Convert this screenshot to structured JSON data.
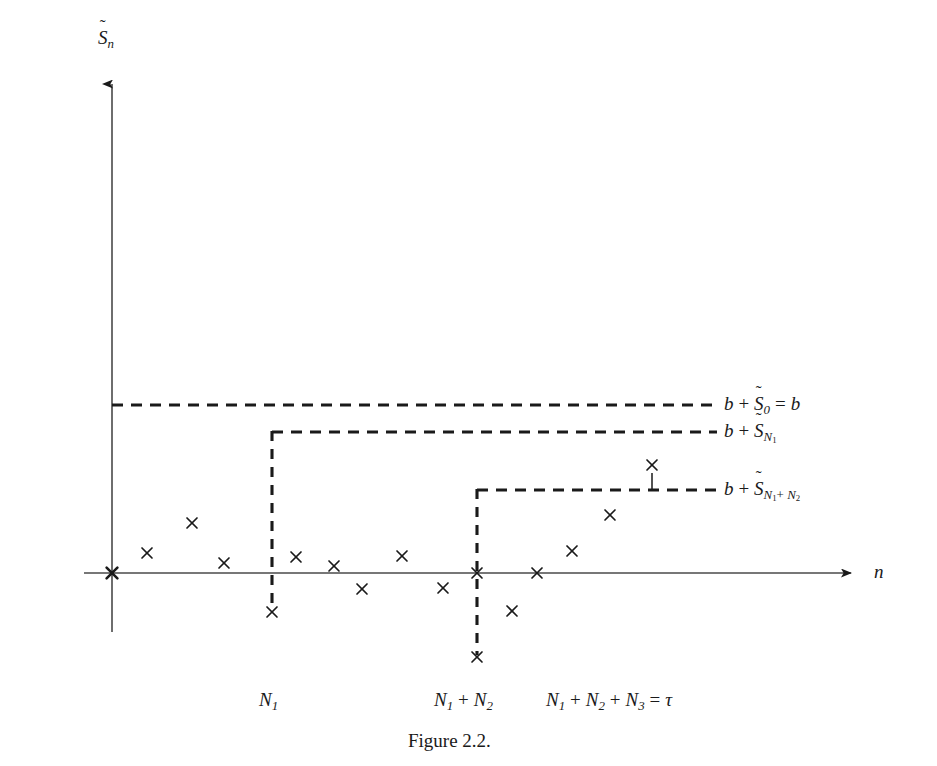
{
  "figure": {
    "caption": "Figure 2.2.",
    "axes": {
      "y_label_base": "S",
      "y_label_sub": "n",
      "y_label_accent": "~",
      "y_label_text": "S̃_n",
      "x_label_text": "n",
      "origin_marker": "x"
    },
    "level_labels": [
      {
        "id": "level-0",
        "prefix": "b",
        "plus": "+",
        "base": "S",
        "accent": "~",
        "sub": "0",
        "suffix_eq": "=",
        "suffix_val": "b",
        "text": "b + S̃0 = b"
      },
      {
        "id": "level-1",
        "prefix": "b",
        "plus": "+",
        "base": "S",
        "accent": "~",
        "sub": "N1",
        "sub_parts": [
          "N",
          "1"
        ],
        "text": "b + S̃_{N1}"
      },
      {
        "id": "level-2",
        "prefix": "b",
        "plus": "+",
        "base": "S",
        "accent": "~",
        "sub": "N1+N2",
        "sub_parts": [
          "N",
          "1",
          "+",
          "N",
          "2"
        ],
        "text": "b + S̃_{N1+N2}"
      }
    ],
    "x_tick_labels": [
      {
        "id": "tick-n1",
        "text": "N1",
        "parts": [
          "N",
          "1"
        ]
      },
      {
        "id": "tick-n1n2",
        "text": "N1 + N2",
        "parts": [
          "N",
          "1",
          "+",
          "N",
          "2"
        ]
      },
      {
        "id": "tick-tau",
        "text": "N1 + N2 + N3 = τ",
        "parts": [
          "N",
          "1",
          "+",
          "N",
          "2",
          "+",
          "N",
          "3",
          "=",
          "τ"
        ]
      }
    ],
    "colors": {
      "ink": "#1a1a1a",
      "axis": "#4a4a4a",
      "dash": "#1a1a1a",
      "background": "#ffffff"
    }
  },
  "chart_data": {
    "type": "scatter",
    "title": "Figure 2.2.",
    "xlabel": "n",
    "ylabel": "S̃_n",
    "grid": false,
    "legend": "none",
    "axis_origin_px": {
      "x": 112,
      "y": 573
    },
    "axis_x_range_px": [
      112,
      858
    ],
    "axis_y_top_px": 78,
    "axis_y_bottom_px": 632,
    "barrier_levels": [
      {
        "name": "b + S̃0 = b",
        "y_px": 405,
        "x_start_px": 112,
        "x_end_px": 717
      },
      {
        "name": "b + S̃_{N1}",
        "y_px": 432,
        "x_start_px": 272,
        "x_end_px": 717
      },
      {
        "name": "b + S̃_{N1+N2}",
        "y_px": 490,
        "x_start_px": 477,
        "x_end_px": 717
      }
    ],
    "ladder_drops": [
      {
        "x_px": 272,
        "y_top_px": 432,
        "y_bottom_px": 612,
        "label": "N1"
      },
      {
        "x_px": 477,
        "y_top_px": 490,
        "y_bottom_px": 657,
        "label": "N1 + N2"
      }
    ],
    "stem_marks": [
      {
        "x_px": 652,
        "y_top_px": 472,
        "y_bottom_px": 490
      }
    ],
    "x_tick_positions_px": [
      272,
      477,
      600
    ],
    "points_px": [
      {
        "x": 112,
        "y": 573,
        "bold": true
      },
      {
        "x": 147,
        "y": 553
      },
      {
        "x": 192,
        "y": 523
      },
      {
        "x": 224,
        "y": 563
      },
      {
        "x": 272,
        "y": 612
      },
      {
        "x": 296,
        "y": 557
      },
      {
        "x": 334,
        "y": 566
      },
      {
        "x": 362,
        "y": 589
      },
      {
        "x": 402,
        "y": 556
      },
      {
        "x": 443,
        "y": 588
      },
      {
        "x": 477,
        "y": 657
      },
      {
        "x": 477,
        "y": 573
      },
      {
        "x": 512,
        "y": 611
      },
      {
        "x": 537,
        "y": 573
      },
      {
        "x": 572,
        "y": 551
      },
      {
        "x": 610,
        "y": 515
      },
      {
        "x": 652,
        "y": 465
      }
    ]
  }
}
